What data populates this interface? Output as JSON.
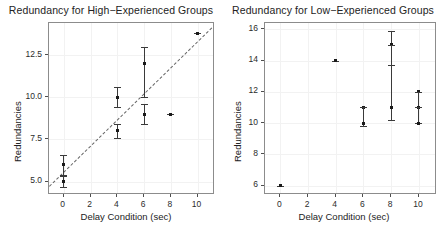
{
  "figure": {
    "width": 444,
    "height": 246,
    "background": "#ffffff",
    "marker_color": "#1a1a1a",
    "errorbar_color": "#3a3a3a",
    "fitline_color": "#666666",
    "grid_color": "#f2f2f2",
    "frame_color": "#8c8c8c"
  },
  "chart_data": [
    {
      "type": "scatter",
      "panel": "left",
      "title": "Redundancy for High−Experienced Groups",
      "xlabel": "Delay Condition (sec)",
      "ylabel": "Redundancies",
      "xlim": [
        -1.1,
        11.3
      ],
      "ylim": [
        4.2,
        14.4
      ],
      "xticks": [
        0,
        2,
        4,
        6,
        8,
        10
      ],
      "xtick_labels": [
        "0",
        "2",
        "4",
        "6",
        "8",
        "10"
      ],
      "yticks": [
        5.0,
        7.5,
        10.0,
        12.5
      ],
      "ytick_labels": [
        "5.0",
        "7.5",
        "10.0",
        "12.5"
      ],
      "grid": true,
      "legend": "none",
      "points": [
        {
          "x": 0,
          "y": 6.0,
          "ylo": 5.4,
          "yhi": 6.6
        },
        {
          "x": 0,
          "y": 5.0,
          "ylo": 4.7,
          "yhi": 5.3
        },
        {
          "x": 4,
          "y": 10.0,
          "ylo": 9.4,
          "yhi": 10.6
        },
        {
          "x": 4,
          "y": 8.0,
          "ylo": 7.6,
          "yhi": 8.4
        },
        {
          "x": 6,
          "y": 12.0,
          "ylo": 10.0,
          "yhi": 13.0
        },
        {
          "x": 6,
          "y": 9.0,
          "ylo": 8.4,
          "yhi": 9.6
        },
        {
          "x": 8,
          "y": 9.0,
          "ylo": 9.0,
          "yhi": 9.0
        },
        {
          "x": 10,
          "y": 13.8,
          "ylo": 13.8,
          "yhi": 13.8
        }
      ],
      "fit_line": {
        "x0": -1.1,
        "y0": 4.75,
        "x1": 11.3,
        "y1": 14.35,
        "style": "dashed"
      }
    },
    {
      "type": "scatter",
      "panel": "right",
      "title": "Redundancy for Low−Experienced Groups",
      "xlabel": "Delay Condition (sec)",
      "ylabel": "Redundancies",
      "xlim": [
        -1.1,
        11.3
      ],
      "ylim": [
        5.4,
        16.4
      ],
      "xticks": [
        0,
        2,
        4,
        6,
        8,
        10
      ],
      "xtick_labels": [
        "0",
        "2",
        "4",
        "6",
        "8",
        "10"
      ],
      "yticks": [
        6,
        8,
        10,
        12,
        14,
        16
      ],
      "ytick_labels": [
        "6",
        "8",
        "10",
        "12",
        "14",
        "16"
      ],
      "grid": true,
      "legend": "none",
      "points": [
        {
          "x": 0,
          "y": 6.0,
          "ylo": 6.0,
          "yhi": 6.0
        },
        {
          "x": 4,
          "y": 14.0,
          "ylo": 14.0,
          "yhi": 14.0
        },
        {
          "x": 6,
          "y": 11.0,
          "ylo": 11.0,
          "yhi": 11.0
        },
        {
          "x": 6,
          "y": 10.0,
          "ylo": 9.8,
          "yhi": 11.0
        },
        {
          "x": 8,
          "y": 15.0,
          "ylo": 13.7,
          "yhi": 15.9
        },
        {
          "x": 8,
          "y": 11.0,
          "ylo": 10.2,
          "yhi": 15.0
        },
        {
          "x": 10,
          "y": 12.0,
          "ylo": 11.0,
          "yhi": 12.0
        },
        {
          "x": 10,
          "y": 11.0,
          "ylo": 10.0,
          "yhi": 12.0
        },
        {
          "x": 10,
          "y": 10.0,
          "ylo": 10.0,
          "yhi": 11.0
        }
      ],
      "fit_line": null
    }
  ]
}
